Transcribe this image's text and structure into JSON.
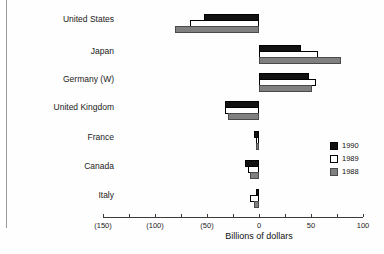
{
  "chart_data": {
    "type": "bar",
    "orientation": "horizontal",
    "title": "",
    "xlabel": "Billions of dollars",
    "ylabel": "",
    "categories": [
      "United States",
      "Japan",
      "Germany (W)",
      "United Kingdom",
      "France",
      "Canada",
      "Italy"
    ],
    "series": [
      {
        "name": "1990",
        "color": "#111111",
        "values": [
          -53,
          40,
          48,
          -33,
          -5,
          -13,
          -1
        ]
      },
      {
        "name": "1989",
        "color": "#ffffff",
        "values": [
          -66,
          57,
          55,
          -33,
          -2,
          -11,
          -9
        ]
      },
      {
        "name": "1988",
        "color": "#808080",
        "values": [
          -81,
          79,
          51,
          -30,
          -3,
          -9,
          -5
        ]
      }
    ],
    "xlim": [
      -150,
      100
    ],
    "xticks": [
      -150,
      -125,
      -100,
      -75,
      -50,
      -25,
      0,
      25,
      50,
      75,
      100
    ],
    "xtick_labels": [
      "(150)",
      "",
      "(100)",
      "",
      "(50)",
      "",
      "0",
      "",
      "50",
      "",
      "100"
    ],
    "grid": false,
    "legend_position": "right-middle"
  },
  "legend": {
    "entries": [
      {
        "label": "1990",
        "swatch": "black-filled-square"
      },
      {
        "label": "1989",
        "swatch": "white-filled-square"
      },
      {
        "label": "1988",
        "swatch": "gray-filled-square"
      }
    ]
  },
  "axis": {
    "x_title": "Billions of dollars"
  }
}
